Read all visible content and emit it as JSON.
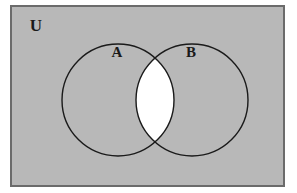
{
  "figure": {
    "kind": "venn-diagram",
    "universe_label": "U",
    "set_labels": [
      "A",
      "B"
    ],
    "colors": {
      "page_background": "#ffffff",
      "universe_fill": "#b8b8b8",
      "frame_border": "#6b6b6b",
      "circle_stroke": "#1a1a1a",
      "intersection_fill": "#ffffff",
      "label_color": "#1a1a1a"
    }
  },
  "frame": {
    "name": "universal-set-rectangle",
    "x": 11,
    "y": 6,
    "width": 273,
    "height": 180,
    "border_width": 2
  },
  "universe": {
    "label": "U",
    "label_x": 36,
    "label_y": 27
  },
  "circles": [
    {
      "id": "set-a",
      "label": "A",
      "cx": 118,
      "cy": 100,
      "r": 56,
      "label_x": 117,
      "label_y": 54,
      "stroke_width": 1.4
    },
    {
      "id": "set-b",
      "label": "B",
      "cx": 192,
      "cy": 100,
      "r": 56,
      "label_x": 191,
      "label_y": 54,
      "stroke_width": 1.4
    }
  ],
  "regions": [
    {
      "id": "a-only",
      "description": "A only",
      "shaded": true,
      "fill": "#b8b8b8"
    },
    {
      "id": "b-only",
      "description": "B only",
      "shaded": true,
      "fill": "#b8b8b8"
    },
    {
      "id": "intersection",
      "description": "A and B",
      "shaded": false,
      "fill": "#ffffff"
    },
    {
      "id": "outside",
      "description": "Outside A and B",
      "shaded": true,
      "fill": "#b8b8b8"
    }
  ]
}
